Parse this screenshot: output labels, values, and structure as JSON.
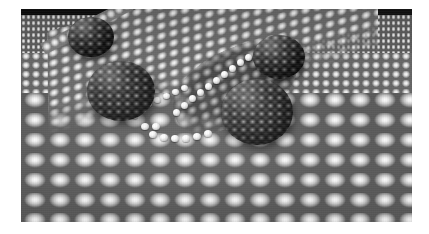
{
  "figure": {
    "title": "Molecular adsorbates on a close-packed metal surface",
    "caption": "",
    "kind": "3d-molecular-render",
    "color_mode": "grayscale",
    "page_background": "#ffffff",
    "plate": {
      "x": 21,
      "y": 9,
      "width": 391,
      "height": 213,
      "background": "#0a0a0a"
    }
  },
  "scene": {
    "void_label": "vacuum background",
    "void_color": "#101010",
    "substrate_label": "close-packed atomic substrate",
    "substrate_color": "#a8a8a8",
    "terrace_label": "upper terrace plateau",
    "terrace_color": "#9e9e9e",
    "step_edge_label": "step edge atom row",
    "step_edge_color": "#f2f2f2",
    "trough_label": "shadowed surface depression",
    "trough_color": "#6d6d6d",
    "highlight_color": "#ffffff",
    "cluster_color": "#4e4e4e"
  },
  "clusters": [
    {
      "id": "cluster-top-left",
      "label": "fullerene cluster top-left",
      "cx": 70,
      "cy": 28,
      "rx": 23,
      "ry": 20
    },
    {
      "id": "cluster-top-right",
      "label": "fullerene cluster top-right",
      "cx": 258,
      "cy": 48,
      "rx": 26,
      "ry": 22
    },
    {
      "id": "cluster-left",
      "label": "fullerene cluster left",
      "cx": 100,
      "cy": 82,
      "rx": 34,
      "ry": 30
    },
    {
      "id": "cluster-center-low",
      "label": "fullerene cluster center-low",
      "cx": 236,
      "cy": 103,
      "rx": 36,
      "ry": 33
    }
  ],
  "adatom_chains": [
    {
      "id": "chain-diagonal",
      "label": "bright adatom chain rising to upper right",
      "atoms": [
        {
          "x": 152,
          "y": 100
        },
        {
          "x": 160,
          "y": 93
        },
        {
          "x": 168,
          "y": 86
        },
        {
          "x": 176,
          "y": 80
        },
        {
          "x": 184,
          "y": 74
        },
        {
          "x": 192,
          "y": 68
        },
        {
          "x": 200,
          "y": 62
        },
        {
          "x": 208,
          "y": 56
        },
        {
          "x": 216,
          "y": 50
        },
        {
          "x": 224,
          "y": 45
        }
      ]
    },
    {
      "id": "chain-lower",
      "label": "bright adatom row at lower terrace front",
      "atoms": [
        {
          "x": 128,
          "y": 122
        },
        {
          "x": 139,
          "y": 125
        },
        {
          "x": 150,
          "y": 126
        },
        {
          "x": 161,
          "y": 126
        },
        {
          "x": 172,
          "y": 124
        },
        {
          "x": 183,
          "y": 121
        },
        {
          "x": 120,
          "y": 114
        },
        {
          "x": 131,
          "y": 114
        }
      ]
    },
    {
      "id": "chain-left",
      "label": "bright adatoms along left step edge",
      "atoms": [
        {
          "x": 116,
          "y": 96
        },
        {
          "x": 124,
          "y": 92
        },
        {
          "x": 110,
          "y": 104
        },
        {
          "x": 133,
          "y": 88
        },
        {
          "x": 142,
          "y": 84
        },
        {
          "x": 151,
          "y": 80
        },
        {
          "x": 160,
          "y": 76
        }
      ]
    }
  ]
}
